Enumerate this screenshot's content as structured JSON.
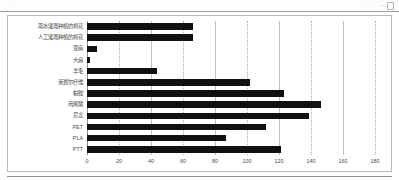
{
  "viewer": {
    "strip_left_text": "···  ···",
    "strip_right_text": "···  ···",
    "zoom_out_icon": "minus-icon",
    "page-icon": "page-icon"
  },
  "chart_data": {
    "type": "bar",
    "orientation": "horizontal",
    "title": "",
    "xlabel": "",
    "ylabel": "",
    "xlim": [
      0,
      180
    ],
    "xticks": [
      0,
      20,
      40,
      60,
      80,
      100,
      120,
      140,
      160,
      180
    ],
    "grid": true,
    "legend": "none",
    "bar_color": "#111111",
    "categories": [
      "雨水灌溉种植的棉花",
      "人工灌溉种植的棉花",
      "亚麻",
      "大麻",
      "羊毛",
      "莱赛尔纤维",
      "黏胶",
      "丙烯酸",
      "尼龙",
      "PET",
      "PLA",
      "PTT"
    ],
    "values": [
      66,
      66,
      6,
      2,
      44,
      102,
      123,
      146,
      139,
      112,
      87,
      121
    ]
  }
}
